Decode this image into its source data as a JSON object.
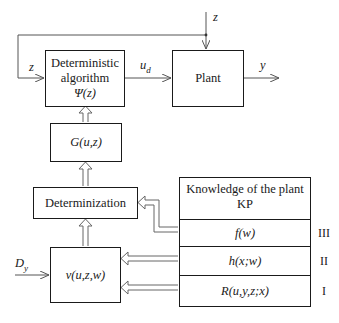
{
  "diagram": {
    "boxes": {
      "det_algorithm": {
        "line1": "Deterministic",
        "line2": "algorithm",
        "line3": "Ψ(z)"
      },
      "plant": {
        "label": "Plant"
      },
      "g": {
        "label": "G(u,z)"
      },
      "determinization": {
        "label": "Determinization"
      },
      "v": {
        "label": "v(u,z,w)"
      }
    },
    "knowledge": {
      "header_line1": "Knowledge of the plant",
      "header_line2": "KP",
      "rows": [
        {
          "label": "f(w)",
          "level": "III"
        },
        {
          "label": "h(x;w)",
          "level": "II"
        },
        {
          "label": "R(u,y,z;x)",
          "level": "I"
        }
      ]
    },
    "signals": {
      "z_top": "z",
      "z_left": "z",
      "u_d_main": "u",
      "u_d_sub": "d",
      "y": "y",
      "D_main": "D",
      "D_sub": "y"
    }
  }
}
